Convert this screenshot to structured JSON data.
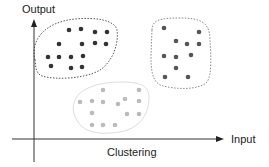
{
  "diagram": {
    "title": "Clustering",
    "x_axis_label": "Input",
    "y_axis_label": "Output",
    "colors": {
      "axis": "#333333",
      "dark_cluster": "#333333",
      "mid_cluster": "#555555",
      "light_cluster": "#bbbbbb",
      "dark_boundary": "#555555",
      "mid_boundary": "#888888",
      "light_boundary": "#dddddd"
    },
    "clusters": [
      {
        "name": "cluster-1",
        "shade": "dark",
        "boundary_style": "dotted",
        "points": [
          [
            69,
            30
          ],
          [
            81,
            29
          ],
          [
            95,
            32
          ],
          [
            107,
            32
          ],
          [
            59,
            44
          ],
          [
            82,
            44
          ],
          [
            95,
            43
          ],
          [
            106,
            44
          ],
          [
            48,
            57
          ],
          [
            59,
            57
          ],
          [
            71,
            57
          ],
          [
            83,
            56
          ],
          [
            51,
            66
          ],
          [
            71,
            68
          ],
          [
            82,
            67
          ]
        ]
      },
      {
        "name": "cluster-2",
        "shade": "medium",
        "boundary_style": "dotted",
        "points": [
          [
            164,
            28
          ],
          [
            199,
            32
          ],
          [
            176,
            41
          ],
          [
            187,
            44
          ],
          [
            199,
            44
          ],
          [
            164,
            56
          ],
          [
            176,
            57
          ],
          [
            191,
            55
          ],
          [
            176,
            68
          ],
          [
            165,
            77
          ],
          [
            188,
            77
          ]
        ]
      },
      {
        "name": "cluster-3",
        "shade": "light",
        "boundary_style": "dotted",
        "points": [
          [
            103,
            90
          ],
          [
            139,
            90
          ],
          [
            80,
            102
          ],
          [
            92,
            101
          ],
          [
            103,
            102
          ],
          [
            118,
            104
          ],
          [
            125,
            99
          ],
          [
            139,
            101
          ],
          [
            92,
            113
          ],
          [
            127,
            114
          ],
          [
            139,
            114
          ],
          [
            92,
            125
          ],
          [
            103,
            125
          ],
          [
            115,
            125
          ]
        ]
      }
    ]
  }
}
